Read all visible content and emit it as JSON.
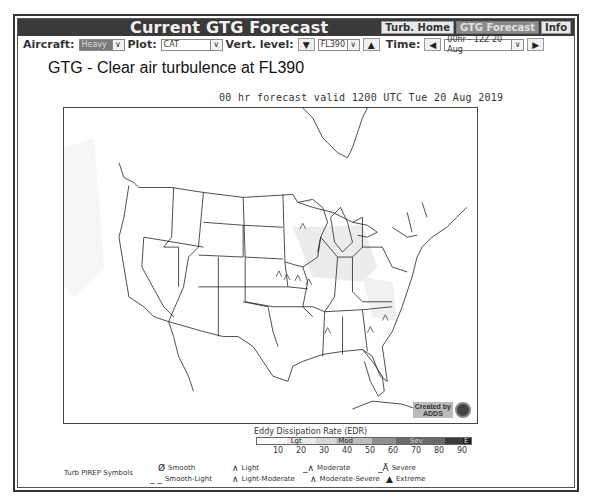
{
  "header": {
    "title": "Current GTG Forecast",
    "nav": [
      {
        "label": "Turb. Home",
        "active": false
      },
      {
        "label": "GTG Forecast",
        "active": true
      },
      {
        "label": "Info",
        "active": false
      }
    ]
  },
  "toolbar": {
    "aircraft_label": "Aircraft:",
    "aircraft_value": "Heavy",
    "plot_label": "Plot:",
    "plot_value": "CAT",
    "level_label": "Vert. level:",
    "level_down_icon": "triangle-down-icon",
    "level_value": "FL390",
    "level_up_icon": "triangle-up-icon",
    "time_label": "Time:",
    "time_prev_icon": "triangle-left-icon",
    "time_value": "00hr - 12Z 20 Aug",
    "time_next_icon": "triangle-right-icon"
  },
  "plot": {
    "title": "GTG - Clear air turbulence at FL390",
    "subtitle": "00 hr forecast valid 1200 UTC Tue 20 Aug 2019",
    "credit_line1": "Created by",
    "credit_line2": "ADDS"
  },
  "legend": {
    "title": "Eddy Dissipation Rate (EDR)",
    "segments": [
      {
        "label": "",
        "color": "#fafafa",
        "width": 30
      },
      {
        "label": "Lgt",
        "color": "#e9e9e9",
        "width": 30
      },
      {
        "label": "",
        "color": "#d6d6d6",
        "width": 20
      },
      {
        "label": "Mod",
        "color": "#bdbdbd",
        "width": 36
      },
      {
        "label": "",
        "color": "#8f8f8f",
        "width": 24
      },
      {
        "label": "Sev",
        "color": "#6a6a6a",
        "width": 50
      },
      {
        "label": "",
        "color": "#3c3c3c",
        "width": 18
      },
      {
        "label": "E",
        "color": "#1e1e1e",
        "width": 8
      }
    ],
    "ticks": [
      "10",
      "20",
      "30",
      "40",
      "50",
      "60",
      "70",
      "80",
      "90"
    ]
  },
  "pirep": {
    "header": "Turb PIREP Symbols",
    "items": [
      {
        "label": "Smooth",
        "symbol": "Ø"
      },
      {
        "label": "Smooth-Light",
        "symbol": "_ _"
      },
      {
        "label": "Light",
        "symbol": "∧"
      },
      {
        "label": "Light-Moderate",
        "symbol": "∧"
      },
      {
        "label": "Moderate",
        "symbol": "_∧"
      },
      {
        "label": "Moderate-Severe",
        "symbol": "∧"
      },
      {
        "label": "Severe",
        "symbol": "_Ä"
      },
      {
        "label": "Extreme",
        "symbol": "▲"
      }
    ]
  }
}
